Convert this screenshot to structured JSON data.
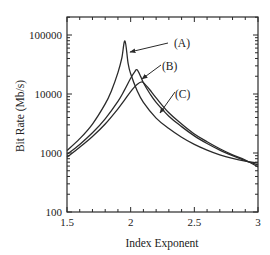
{
  "chart_data": {
    "type": "line",
    "title": "",
    "xlabel": "Index Exponent",
    "ylabel": "Bit Rate (Mb/s)",
    "xlim": [
      1.5,
      3
    ],
    "ylim": [
      100,
      200000
    ],
    "yscale": "log",
    "grid": false,
    "legend": "none (curves labeled by arrows)",
    "x_ticks": [
      {
        "value": 1.5,
        "label": "1.5"
      },
      {
        "value": 2,
        "label": "2"
      },
      {
        "value": 2.5,
        "label": "2.5"
      },
      {
        "value": 3,
        "label": "3"
      }
    ],
    "y_ticks": [
      {
        "value": 100,
        "label": "100"
      },
      {
        "value": 1000,
        "label": "1000"
      },
      {
        "value": 10000,
        "label": "10000"
      },
      {
        "value": 100000,
        "label": "100000"
      }
    ],
    "series": [
      {
        "name": "(A)",
        "peak": {
          "x": 1.955,
          "y": 79000
        },
        "x": [
          1.5,
          1.6,
          1.7,
          1.8,
          1.85,
          1.9,
          1.93,
          1.955,
          1.98,
          2.0,
          2.05,
          2.1,
          2.2,
          2.3,
          2.4,
          2.5,
          2.6,
          2.7,
          2.8,
          2.9,
          3.0
        ],
        "values": [
          1100,
          1750,
          3100,
          6800,
          11500,
          23000,
          40000,
          79000,
          33000,
          22000,
          11500,
          7200,
          3900,
          2600,
          1850,
          1400,
          1120,
          930,
          810,
          730,
          680
        ]
      },
      {
        "name": "(B)",
        "peak": {
          "x": 2.05,
          "y": 25700
        },
        "x": [
          1.5,
          1.6,
          1.7,
          1.8,
          1.9,
          1.95,
          2.0,
          2.03,
          2.05,
          2.08,
          2.1,
          2.15,
          2.2,
          2.3,
          2.4,
          2.5,
          2.6,
          2.7,
          2.8,
          2.9,
          3.0
        ],
        "values": [
          950,
          1400,
          2200,
          3800,
          7500,
          11500,
          18500,
          23500,
          25700,
          19500,
          15500,
          10200,
          7200,
          4200,
          2800,
          1950,
          1450,
          1120,
          900,
          740,
          630
        ]
      },
      {
        "name": "(C)",
        "peak": {
          "x": 2.09,
          "y": 16000
        },
        "x": [
          1.5,
          1.6,
          1.7,
          1.8,
          1.9,
          1.95,
          2.0,
          2.05,
          2.09,
          2.12,
          2.15,
          2.2,
          2.3,
          2.4,
          2.5,
          2.6,
          2.7,
          2.8,
          2.9,
          3.0
        ],
        "values": [
          850,
          1250,
          1900,
          3100,
          5600,
          7800,
          11000,
          14500,
          16000,
          14000,
          11800,
          8600,
          4800,
          3100,
          2100,
          1550,
          1180,
          930,
          760,
          580
        ]
      }
    ],
    "annotations": [
      {
        "label": "(A)",
        "text_x": 174,
        "text_y": 47,
        "arrow_from": [
          168,
          43
        ],
        "arrow_to": [
          130,
          52
        ]
      },
      {
        "label": "(B)",
        "text_x": 162,
        "text_y": 70,
        "arrow_from": [
          161,
          65
        ],
        "arrow_to": [
          142,
          79
        ]
      },
      {
        "label": "(C)",
        "text_x": 175,
        "text_y": 98,
        "arrow_from": [
          175,
          92
        ],
        "arrow_to": [
          160,
          113
        ]
      }
    ]
  }
}
